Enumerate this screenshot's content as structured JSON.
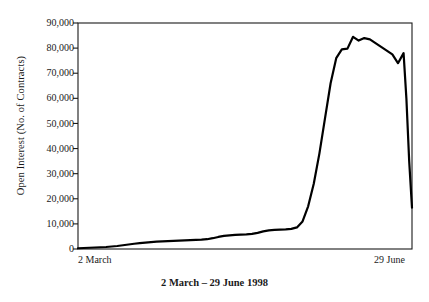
{
  "chart_data": {
    "type": "line",
    "title": "",
    "caption": "2 March – 29 June 1998",
    "xlabel": "",
    "ylabel": "Open Interest (No. of Contracts)",
    "grid": false,
    "legend": false,
    "ylim": [
      0,
      90000
    ],
    "yticks": [
      0,
      10000,
      20000,
      30000,
      40000,
      50000,
      60000,
      70000,
      80000,
      90000
    ],
    "ytick_labels": [
      "0",
      "10,000",
      "20,000",
      "30,000",
      "40,000",
      "50,000",
      "60,000",
      "70,000",
      "80,000",
      "90,000"
    ],
    "xtick_labels": [
      "2 March",
      "29 June"
    ],
    "xlim": [
      0,
      119
    ],
    "x_unit": "days from 2 March 1998",
    "series": [
      {
        "name": "Open Interest",
        "color": "#000000",
        "x": [
          0,
          2,
          4,
          6,
          8,
          10,
          12,
          14,
          16,
          18,
          20,
          22,
          24,
          26,
          28,
          30,
          32,
          34,
          36,
          38,
          40,
          42,
          44,
          46,
          48,
          50,
          52,
          54,
          56,
          58,
          60,
          62,
          64,
          66,
          68,
          70,
          72,
          74,
          76,
          78,
          80,
          82,
          84,
          86,
          88,
          90,
          92,
          94,
          96,
          98,
          100,
          102,
          104,
          106,
          108,
          110,
          112,
          114,
          116,
          117,
          118,
          119
        ],
        "values": [
          300,
          400,
          500,
          600,
          700,
          800,
          1000,
          1200,
          1500,
          1800,
          2100,
          2300,
          2500,
          2700,
          2900,
          3000,
          3100,
          3200,
          3300,
          3400,
          3500,
          3600,
          3700,
          3900,
          4300,
          4800,
          5200,
          5400,
          5600,
          5700,
          5800,
          6000,
          6400,
          7000,
          7400,
          7600,
          7700,
          7800,
          8000,
          8600,
          11000,
          17000,
          26000,
          38000,
          52000,
          66000,
          76000,
          79500,
          79800,
          84500,
          83000,
          84000,
          83500,
          82000,
          80500,
          79000,
          77500,
          74000,
          78000,
          60000,
          35000,
          16500
        ]
      }
    ]
  },
  "axes": {
    "frame_color": "#1a1a1a",
    "line_color": "#000000",
    "background": "#ffffff"
  }
}
